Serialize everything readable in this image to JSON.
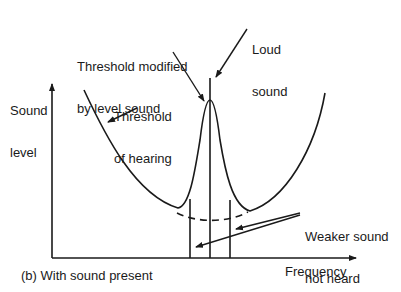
{
  "diagram": {
    "caption": "(b) With sound present",
    "axes": {
      "y_label_line1": "Sound",
      "y_label_line2": "level",
      "x_label": "Frequency"
    },
    "annotations": {
      "threshold_modified_line1": "Threshold modified",
      "threshold_modified_line2": "by level sound",
      "loud_sound_line1": "Loud",
      "loud_sound_line2": "sound",
      "threshold_hearing_line1": "Threshold",
      "threshold_hearing_line2": "of hearing",
      "weaker_line1": "Weaker sound",
      "weaker_line2": "not heard"
    },
    "colors": {
      "ink": "#1a1a1a",
      "background": "#ffffff"
    }
  }
}
